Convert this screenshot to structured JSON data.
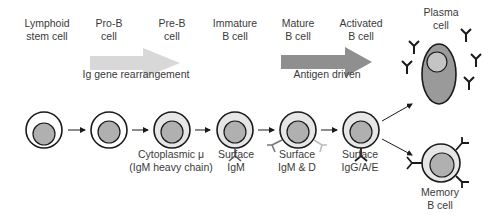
{
  "stages": [
    {
      "id": "lymphoid",
      "label_line1": "Lymphoid",
      "label_line2": "stem cell"
    },
    {
      "id": "pro-b",
      "label_line1": "Pro-B",
      "label_line2": "cell"
    },
    {
      "id": "pre-b",
      "label_line1": "Pre-B",
      "label_line2": "cell"
    },
    {
      "id": "immature-b",
      "label_line1": "Immature",
      "label_line2": "B cell"
    },
    {
      "id": "mature-b",
      "label_line1": "Mature",
      "label_line2": "B cell"
    },
    {
      "id": "activated-b",
      "label_line1": "Activated",
      "label_line2": "B cell"
    },
    {
      "id": "plasma",
      "label_line1": "Plasma",
      "label_line2": "cell"
    },
    {
      "id": "memory",
      "label_line1": "Memory",
      "label_line2": "B cell"
    }
  ],
  "phases": {
    "rearrangement": "Ig gene rearrangement",
    "antigen": "Antigen driven"
  },
  "markers": {
    "pre_b_line1": "Cytoplasmic μ",
    "pre_b_line2": "(IgM heavy chain)",
    "immature_line1": "Surface",
    "immature_line2": "IgM",
    "mature_line1": "Surface",
    "mature_line2": "IgM & D",
    "activated_line1": "Surface",
    "activated_line2": "IgG/A/E"
  },
  "colors": {
    "outline": "#1a1a1a",
    "nucleus": "#b0b0b0",
    "cytoplasm_light": "#e6e6e6",
    "plasma_body": "#9a9a9a",
    "arrow_light": "#d6d6d6",
    "arrow_dark": "#8f8f8f"
  }
}
